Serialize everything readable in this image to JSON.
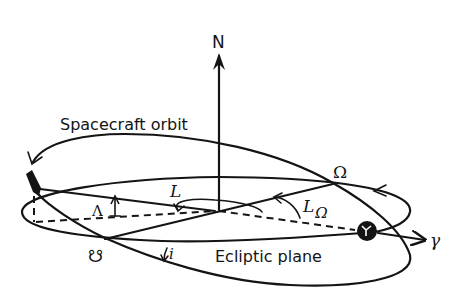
{
  "diagram": {
    "labels": {
      "north": "N",
      "spacecraft_orbit": "Spacecraft orbit",
      "ascending_node": "Ω",
      "descending_node": "☋",
      "ecliptic_plane": "Ecliptic plane",
      "vernal_equinox": "γ",
      "longitude": "L",
      "longitude_of_node": "L",
      "longitude_of_node_subscript": "Ω",
      "latitude": "Λ",
      "inclination": "i"
    },
    "colors": {
      "ink": "#141414",
      "background": "#ffffff"
    }
  }
}
